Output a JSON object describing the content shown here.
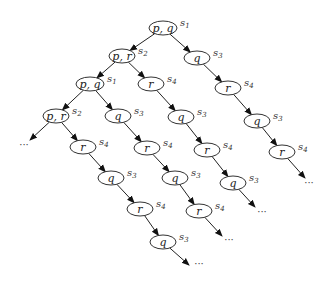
{
  "diagram": {
    "type": "computation-tree",
    "nodes": [
      {
        "id": "n0",
        "label": "p, q",
        "state": "s",
        "sub": "1",
        "x": 163,
        "y": 28,
        "w": 28
      },
      {
        "id": "n1",
        "label": "p, r",
        "state": "s",
        "sub": "2",
        "x": 122,
        "y": 56,
        "w": 26
      },
      {
        "id": "n2",
        "label": "q",
        "state": "s",
        "sub": "3",
        "x": 197,
        "y": 58,
        "w": 26
      },
      {
        "id": "n3",
        "label": "p, q",
        "state": "s",
        "sub": "1",
        "x": 90,
        "y": 84,
        "w": 28
      },
      {
        "id": "n4",
        "label": "r",
        "state": "s",
        "sub": "4",
        "x": 151,
        "y": 84,
        "w": 26
      },
      {
        "id": "n5",
        "label": "r",
        "state": "s",
        "sub": "4",
        "x": 228,
        "y": 88,
        "w": 26
      },
      {
        "id": "n6",
        "label": "p, r",
        "state": "s",
        "sub": "2",
        "x": 56,
        "y": 116,
        "w": 26
      },
      {
        "id": "n7",
        "label": "q",
        "state": "s",
        "sub": "3",
        "x": 118,
        "y": 116,
        "w": 26
      },
      {
        "id": "n8",
        "label": "q",
        "state": "s",
        "sub": "3",
        "x": 181,
        "y": 117,
        "w": 26
      },
      {
        "id": "n9",
        "label": "q",
        "state": "s",
        "sub": "3",
        "x": 257,
        "y": 121,
        "w": 26
      },
      {
        "id": "n10",
        "label": "r",
        "state": "s",
        "sub": "4",
        "x": 83,
        "y": 147,
        "w": 26
      },
      {
        "id": "n11",
        "label": "r",
        "state": "s",
        "sub": "4",
        "x": 147,
        "y": 148,
        "w": 26
      },
      {
        "id": "n12",
        "label": "r",
        "state": "s",
        "sub": "4",
        "x": 207,
        "y": 150,
        "w": 26
      },
      {
        "id": "n13",
        "label": "r",
        "state": "s",
        "sub": "4",
        "x": 282,
        "y": 152,
        "w": 26
      },
      {
        "id": "n14",
        "label": "q",
        "state": "s",
        "sub": "3",
        "x": 111,
        "y": 178,
        "w": 26
      },
      {
        "id": "n15",
        "label": "q",
        "state": "s",
        "sub": "3",
        "x": 175,
        "y": 178,
        "w": 26
      },
      {
        "id": "n16",
        "label": "q",
        "state": "s",
        "sub": "3",
        "x": 233,
        "y": 183,
        "w": 26
      },
      {
        "id": "n17",
        "label": "r",
        "state": "s",
        "sub": "4",
        "x": 140,
        "y": 209,
        "w": 26
      },
      {
        "id": "n18",
        "label": "r",
        "state": "s",
        "sub": "4",
        "x": 199,
        "y": 211,
        "w": 26
      },
      {
        "id": "n19",
        "label": "q",
        "state": "s",
        "sub": "3",
        "x": 163,
        "y": 242,
        "w": 26
      }
    ],
    "edges": [
      [
        "n0",
        "n1"
      ],
      [
        "n0",
        "n2"
      ],
      [
        "n1",
        "n3"
      ],
      [
        "n1",
        "n4"
      ],
      [
        "n2",
        "n5"
      ],
      [
        "n3",
        "n6"
      ],
      [
        "n3",
        "n7"
      ],
      [
        "n4",
        "n8"
      ],
      [
        "n5",
        "n9"
      ],
      [
        "n6",
        "e0"
      ],
      [
        "n6",
        "n10"
      ],
      [
        "n7",
        "n11"
      ],
      [
        "n8",
        "n12"
      ],
      [
        "n9",
        "n13"
      ],
      [
        "n10",
        "n14"
      ],
      [
        "n11",
        "n15"
      ],
      [
        "n12",
        "n16"
      ],
      [
        "n13",
        "e1"
      ],
      [
        "n14",
        "n17"
      ],
      [
        "n15",
        "n18"
      ],
      [
        "n16",
        "e2"
      ],
      [
        "n17",
        "n19"
      ],
      [
        "n18",
        "e3"
      ],
      [
        "n19",
        "e4"
      ]
    ],
    "ellipsis_points": [
      {
        "id": "e0",
        "x": 30,
        "y": 140,
        "dots_x": 24,
        "dots_y": 148
      },
      {
        "id": "e1",
        "x": 305,
        "y": 178,
        "dots_x": 309,
        "dots_y": 186
      },
      {
        "id": "e2",
        "x": 255,
        "y": 207,
        "dots_x": 262,
        "dots_y": 215
      },
      {
        "id": "e3",
        "x": 222,
        "y": 236,
        "dots_x": 229,
        "dots_y": 243
      },
      {
        "id": "e4",
        "x": 189,
        "y": 265,
        "dots_x": 199,
        "dots_y": 267
      }
    ],
    "ellipsis_text": "···"
  }
}
